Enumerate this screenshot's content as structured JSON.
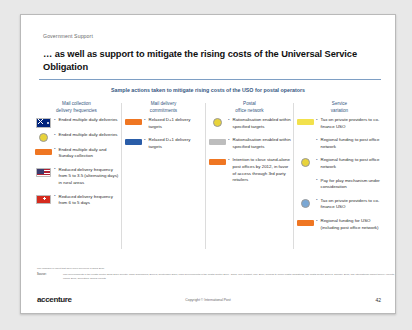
{
  "slide": {
    "eyebrow": "Government Support",
    "title": "… as well as support to mitigate the rising costs of the Universal Service Obligation",
    "subtitle": "Sample actions taken to mitigate rising costs of the USO for postal operators",
    "columns": [
      {
        "header": "Mail collection\ndelivery frequencies",
        "rows": [
          {
            "icon": "flag-australia-icon",
            "icon_style": "f-au",
            "icon_type": "flag",
            "text": "Ended multiple daily deliveries"
          },
          {
            "icon": "badge-yellow-icon",
            "icon_style": "circ-yellow",
            "icon_type": "circle",
            "text": "Ended multiple daily deliveries"
          },
          {
            "icon": "badge-orange-icon",
            "icon_style": "badge-orange",
            "icon_type": "badge",
            "text": "Ended multiple daily and Sunday collection"
          },
          {
            "icon": "flag-usa-icon",
            "icon_style": "f-us",
            "icon_type": "flag",
            "text": "Reduced delivery frequency from 5 to 3.5 (alternating days) in rural areas"
          },
          {
            "icon": "flag-switzerland-icon",
            "icon_style": "f-ch",
            "icon_type": "flag",
            "text": "Reduced delivery frequency from 6 to 5 days"
          }
        ]
      },
      {
        "header": "Mail delivery\ncommitments",
        "rows": [
          {
            "icon": "badge-orange-icon",
            "icon_style": "badge-orange",
            "icon_type": "badge",
            "text": "Relaxed D+1 delivery targets"
          },
          {
            "icon": "badge-blue-icon",
            "icon_style": "badge-blue",
            "icon_type": "badge",
            "text": "Relaxed D+1 delivery targets"
          }
        ]
      },
      {
        "header": "Postal\noffice network",
        "rows": [
          {
            "icon": "badge-yellow-icon",
            "icon_style": "circ-yellow",
            "icon_type": "circle",
            "text": "Rationalisation enabled within specified targets"
          },
          {
            "icon": "badge-grey-icon",
            "icon_style": "badge-grey",
            "icon_type": "badge",
            "text": "Rationalisation enabled within specified targets"
          },
          {
            "icon": "badge-orange-icon",
            "icon_style": "badge-orange",
            "icon_type": "badge",
            "text": "Intention to close stand-alone post offices by 2012, in favor of access through 3rd party retailers"
          }
        ]
      },
      {
        "header": "Service\nvariation",
        "rows": [
          {
            "icon": "badge-yellow-icon",
            "icon_style": "badge-yellow",
            "icon_type": "badge",
            "text": "Tax on private providers to co-finance USO"
          },
          {
            "icon": "",
            "icon_style": "",
            "icon_type": "none",
            "text": "Regional funding to post office network"
          },
          {
            "icon": "badge-yellow2-icon",
            "icon_style": "circ-yellow",
            "icon_type": "circle",
            "text": "Regional funding to post office network"
          },
          {
            "icon": "",
            "icon_style": "",
            "icon_type": "none",
            "text": "Pay for play mechanism under consideration"
          },
          {
            "icon": "badge-lightblue-icon",
            "icon_style": "circ-blue",
            "icon_type": "circle",
            "text": "Tax on private providers to co-finance USO"
          },
          {
            "icon": "badge-orange2-icon",
            "icon_style": "badge-orange",
            "icon_type": "badge",
            "text": "Regional funding for USO (including post office network)"
          }
        ]
      }
    ],
    "source_note": "The changes in effect that have been delivered in 2008-2010",
    "source_label": "Source:",
    "source_body": "Mail developments in the Postal Sector 2008-2010 Country Case Summaries, Ecorys, September 2010; Main developments in the Postal Sector 2006 - 2008, WIK Consult, May 2009; Turning to online postal obligations, the postal sector, Ecorys, January 2011; The international market survey reports, ITC, March 2007; Operators' annual reports",
    "logo": "accenture",
    "copyright": "Copyright © International Post",
    "page_number": "42"
  }
}
